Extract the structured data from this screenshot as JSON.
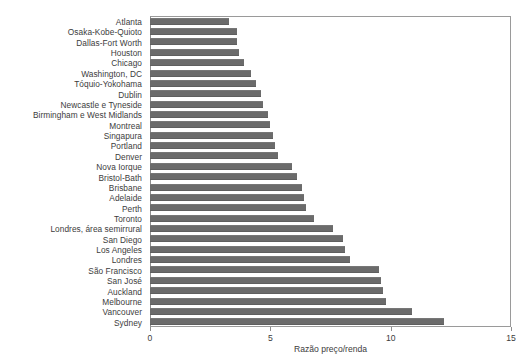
{
  "chart_data": {
    "type": "bar",
    "orientation": "horizontal",
    "title": "",
    "subtitle": "",
    "xlabel": "Razão preço/renda",
    "ylabel": "",
    "xlim": [
      0,
      15
    ],
    "xticks": [
      0,
      5,
      10,
      15
    ],
    "xtick_labels": [
      "0",
      "5",
      "10",
      "15"
    ],
    "grid": false,
    "legend": null,
    "bar_color": "#6b6b6b",
    "frame_color": "#9a9a9a",
    "categories": [
      "Atlanta",
      "Osaka-Kobe-Quioto",
      "Dallas-Fort Worth",
      "Houston",
      "Chicago",
      "Washington, DC",
      "Tóquio-Yokohama",
      "Dublin",
      "Newcastle e Tyneside",
      "Birmingham e West Midlands",
      "Montreal",
      "Singapura",
      "Portland",
      "Denver",
      "Nova Iorque",
      "Bristol-Bath",
      "Brisbane",
      "Adelaide",
      "Perth",
      "Toronto",
      "Londres, área semirrural",
      "San Diego",
      "Los Angeles",
      "Londres",
      "São Francisco",
      "San José",
      "Auckland",
      "Melbourne",
      "Vancouver",
      "Sydney"
    ],
    "values": [
      3.3,
      3.6,
      3.6,
      3.7,
      3.9,
      4.2,
      4.4,
      4.6,
      4.7,
      4.9,
      5.0,
      5.1,
      5.2,
      5.3,
      5.9,
      6.1,
      6.3,
      6.4,
      6.5,
      6.8,
      7.6,
      8.0,
      8.1,
      8.3,
      9.5,
      9.6,
      9.7,
      9.8,
      10.9,
      12.2
    ]
  }
}
